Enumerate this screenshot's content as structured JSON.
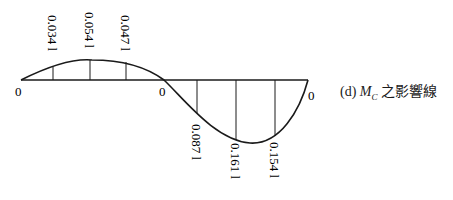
{
  "caption": {
    "prefix": "(d)",
    "symbol": "M",
    "subscript": "C",
    "suffix": "之影響線"
  },
  "zero_labels": [
    "0",
    "0",
    "0"
  ],
  "positive_ordinates": [
    {
      "label": "0.034 l",
      "value": 0.034,
      "x": 53,
      "y": 67
    },
    {
      "label": "0.054 l",
      "value": 0.054,
      "x": 90,
      "y": 60
    },
    {
      "label": "0.047 l",
      "value": 0.047,
      "x": 126,
      "y": 63
    }
  ],
  "negative_ordinates": [
    {
      "label": "0.087 l",
      "value": -0.087,
      "x": 197,
      "y": 113
    },
    {
      "label": "0.161 l",
      "value": -0.161,
      "x": 236,
      "y": 139
    },
    {
      "label": "0.154 l",
      "value": -0.154,
      "x": 275,
      "y": 136
    }
  ],
  "colors": {
    "line": "#1a1a1a",
    "background": "#ffffff"
  }
}
